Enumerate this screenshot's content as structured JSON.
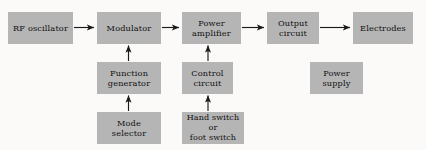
{
  "diagram": {
    "type": "block-diagram",
    "background_color": "#fbfaf8",
    "box_fill_color": "#b5b5b5",
    "line_color": "#1a1a1a",
    "nodes": [
      {
        "id": "rf-oscillator",
        "lines": [
          "RF oscillator"
        ],
        "row": "top"
      },
      {
        "id": "modulator",
        "lines": [
          "Modulator"
        ],
        "row": "top"
      },
      {
        "id": "power-amplifier",
        "lines": [
          "Power",
          "amplifier"
        ],
        "row": "top"
      },
      {
        "id": "output-circuit",
        "lines": [
          "Output",
          "circuit"
        ],
        "row": "top"
      },
      {
        "id": "electrodes",
        "lines": [
          "Electrodes"
        ],
        "row": "top"
      },
      {
        "id": "function-generator",
        "lines": [
          "Function",
          "generator"
        ],
        "row": "middle"
      },
      {
        "id": "control-circuit",
        "lines": [
          "Control",
          "circuit"
        ],
        "row": "middle"
      },
      {
        "id": "power-supply",
        "lines": [
          "Power",
          "supply"
        ],
        "row": "middle"
      },
      {
        "id": "mode-selector",
        "lines": [
          "Mode",
          "selector"
        ],
        "row": "bottom"
      },
      {
        "id": "switch",
        "lines": [
          "Hand switch",
          "or",
          "foot switch"
        ],
        "row": "bottom"
      }
    ],
    "connections": [
      {
        "id": "rf-oscillator-to-modulator",
        "from": "rf-oscillator",
        "to": "modulator",
        "direction": "right"
      },
      {
        "id": "modulator-to-power-amplifier",
        "from": "modulator",
        "to": "power-amplifier",
        "direction": "right"
      },
      {
        "id": "power-amplifier-to-output-circuit",
        "from": "power-amplifier",
        "to": "output-circuit",
        "direction": "right"
      },
      {
        "id": "output-circuit-to-electrodes",
        "from": "output-circuit",
        "to": "electrodes",
        "direction": "right"
      },
      {
        "id": "function-generator-to-modulator",
        "from": "function-generator",
        "to": "modulator",
        "direction": "up"
      },
      {
        "id": "mode-selector-to-function-generator",
        "from": "mode-selector",
        "to": "function-generator",
        "direction": "up"
      },
      {
        "id": "control-circuit-to-power-amplifier",
        "from": "control-circuit",
        "to": "power-amplifier",
        "direction": "up"
      },
      {
        "id": "switch-to-control-circuit",
        "from": "switch",
        "to": "control-circuit",
        "direction": "up"
      }
    ]
  }
}
